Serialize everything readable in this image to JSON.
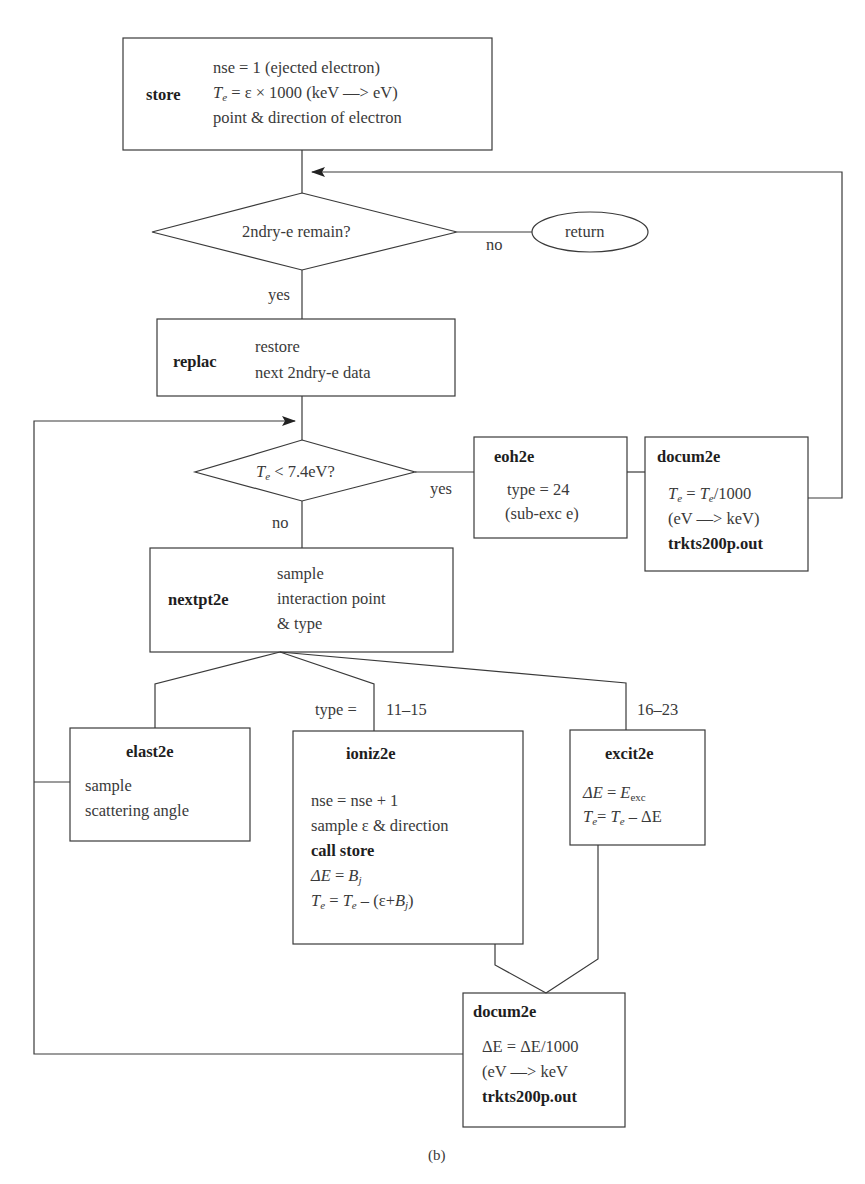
{
  "diagram": {
    "caption": "(b)",
    "nodes": {
      "store": {
        "title": "store",
        "lines": [
          "nse = 1 (ejected electron)",
          "= ε × 1000 (keV —> eV)",
          "point & direction of electron"
        ],
        "te_symbol": "T",
        "te_sub": "e"
      },
      "decision_remain": {
        "text": "2ndry-e remain?",
        "no_label": "no",
        "yes_label": "yes"
      },
      "return": {
        "text": "return"
      },
      "replac": {
        "title": "replac",
        "lines": [
          "restore",
          "next 2ndry-e data"
        ]
      },
      "decision_energy": {
        "te_symbol": "T",
        "te_sub": "e",
        "text": " < 7.4eV?",
        "yes_label": "yes",
        "no_label": "no"
      },
      "eoh2e": {
        "title": "eoh2e",
        "lines": [
          "type = 24",
          "(sub-exc e)"
        ]
      },
      "docum2e_top": {
        "title": "docum2e",
        "line1_a": "T",
        "line1_sub_a": "e",
        "line1_mid": " = ",
        "line1_b": "T",
        "line1_sub_b": "e",
        "line1_end": "/1000",
        "line2": "(eV —> keV)",
        "file": "trkts200p.out"
      },
      "nextpt2e": {
        "title": "nextpt2e",
        "lines": [
          "sample",
          "interaction point",
          "& type"
        ]
      },
      "branch_labels": {
        "type_prefix": "type =",
        "ioniz_range": "11–15",
        "excit_range": "16–23"
      },
      "elast2e": {
        "title": "elast2e",
        "lines": [
          "sample",
          "scattering angle"
        ]
      },
      "ioniz2e": {
        "title": "ioniz2e",
        "line1": "nse = nse + 1",
        "line2": "sample ε & direction",
        "line3": "call store",
        "line4_a": "ΔE",
        "line4_mid": " = ",
        "line4_b": "B",
        "line4_sub": "j",
        "line5_a": "T",
        "line5_sub_a": "e",
        "line5_mid": " = ",
        "line5_b": "T",
        "line5_sub_b": "e",
        "line5_rest": " – (ε+",
        "line5_c": "B",
        "line5_sub_c": "j",
        "line5_end": ")"
      },
      "excit2e": {
        "title": "excit2e",
        "line1_a": "ΔE",
        "line1_mid": " = ",
        "line1_b": "E",
        "line1_sub": "exc",
        "line2_a": "T",
        "line2_sub_a": "e",
        "line2_mid": "= ",
        "line2_b": "T",
        "line2_sub_b": "e",
        "line2_end": " – ΔE"
      },
      "docum2e_bottom": {
        "title": "docum2e",
        "line1": "ΔE = ΔE/1000",
        "line2": "(eV —> keV",
        "file": "trkts200p.out"
      }
    },
    "colors": {
      "stroke": "#3a3a3a",
      "text": "#3a3a3a",
      "background": "#ffffff"
    }
  }
}
